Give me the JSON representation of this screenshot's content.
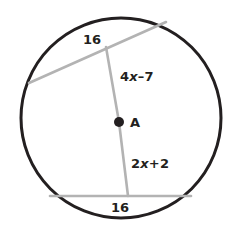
{
  "figure": {
    "type": "circle-geometry-diagram",
    "colors": {
      "circle_stroke": "#231f20",
      "chord_stroke": "#b3b3b3",
      "diameter_stroke": "#b3b3b3",
      "center_dot": "#231f20",
      "text": "#231f20",
      "background": "#ffffff"
    },
    "circle": {
      "center_x": 121,
      "center_y": 118,
      "radius": 100,
      "stroke_width": 3
    },
    "center_point": {
      "label": "A",
      "x": 119,
      "y": 122,
      "dot_radius": 5
    },
    "chords": [
      {
        "name": "upper-chord",
        "label": "16",
        "x1": 29,
        "y1": 83,
        "x2": 166,
        "y2": 22
      },
      {
        "name": "lower-chord",
        "label": "16",
        "x1": 50,
        "y1": 196,
        "x2": 191,
        "y2": 196
      }
    ],
    "diameter": {
      "name": "perpendicular-diameter",
      "x1": 106,
      "y1": 47,
      "x2": 128,
      "y2": 196,
      "upper_segment_label_parts": {
        "coefficient": "4",
        "variable": "x",
        "operator_term": "–7"
      },
      "lower_segment_label_parts": {
        "coefficient": "2",
        "variable": "x",
        "operator_term": "+2"
      },
      "upper_segment_label": "4x–7",
      "lower_segment_label": "2x+2"
    }
  }
}
